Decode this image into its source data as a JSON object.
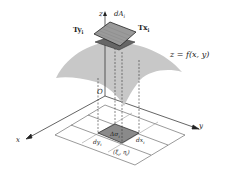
{
  "figure": {
    "colors": {
      "surface": "#c8c8c8",
      "tangent_patch": "#9a9a9a",
      "base_patch": "#8a8a8a",
      "lines": "#333333",
      "grid": "#555555"
    },
    "labels": {
      "z_axis": "z",
      "y_axis": "y",
      "x_axis": "x",
      "origin": "O",
      "dA": "dA",
      "dA_sub": "i",
      "Ty": "Ty",
      "Ty_sub": "i",
      "Tx": "Tx",
      "Tx_sub": "i",
      "surface_eq": "z = f(x, y)",
      "delta_sigma": "Δσ",
      "delta_sigma_sub": "i",
      "dy": "dy",
      "dy_sub": "i",
      "dx": "dx",
      "dx_sub": "i",
      "point": "(ξ",
      "point_sub1": "i",
      "point_mid": ", η",
      "point_sub2": "i",
      "point_end": ")"
    }
  }
}
